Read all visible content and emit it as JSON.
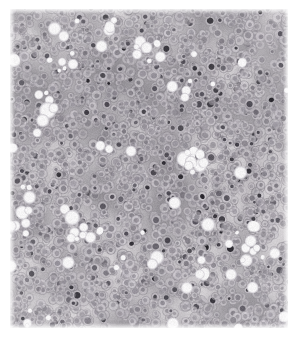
{
  "image": {
    "kind": "histopathology-micrograph",
    "subject": "dense sheet of round tumour cells with hyperchromatic nuclei and scattered clear lacunae",
    "stain_appearance": "desaturated haematoxylin-and-eosin, near-greyscale with faint lavender cast",
    "width": 296,
    "height": 337,
    "background_color": "#ffffff",
    "margins": {
      "top": 9,
      "right": 8,
      "bottom": 9,
      "left": 10
    },
    "tissue_area": {
      "x": 10,
      "y": 9,
      "width": 278,
      "height": 319
    },
    "caption": "Histological section: densely cellular field of uniform round cells with dark nuclei, interspersed pale vacuolar spaces and faint fibrous streaks."
  },
  "palette": {
    "paper_white": "#ffffff",
    "tissue_base": "#b9b5ba",
    "tissue_light": "#d6d3d6",
    "tissue_dark": "#8d8a90",
    "cytoplasm": "#c2bec4",
    "nucleus_mid": "#7e7a83",
    "nucleus_dark": "#4a4750",
    "nucleus_black": "#2b2930",
    "lacuna_white": "#f6f5f6",
    "lacuna_rim": "#cecbd1",
    "fiber_streak": "#a9a5ac"
  },
  "texture": {
    "noise_amount": 22,
    "base_blotch_count": 180,
    "base_blotch_radius": [
      14,
      46
    ],
    "cell_count": 2600,
    "cell_radius": [
      3.0,
      5.6
    ],
    "nucleus_ratio": [
      0.38,
      0.62
    ],
    "dark_nucleus_fraction": 0.17,
    "very_dark_nucleus_fraction": 0.055,
    "lacuna_count": 46,
    "lacuna_radius": [
      3.5,
      11.0
    ],
    "lacuna_cluster_count": 9,
    "fiber_streak_count": 26,
    "vignette_strength": 0.06,
    "seed": 20250117
  },
  "features": [
    {
      "name": "large-lacuna-upper-left",
      "x": 60,
      "y": 34,
      "radius": 9
    },
    {
      "name": "large-lacuna-upper-mid",
      "x": 107,
      "y": 31,
      "radius": 8
    },
    {
      "name": "lacuna-cluster-left-mid",
      "x": 48,
      "y": 104,
      "radius": 11
    },
    {
      "name": "lacuna-cluster-center",
      "x": 107,
      "y": 148,
      "radius": 10
    },
    {
      "name": "lacuna-cluster-center-right",
      "x": 193,
      "y": 157,
      "radius": 12
    },
    {
      "name": "lacuna-cluster-lower-left",
      "x": 66,
      "y": 216,
      "radius": 10
    },
    {
      "name": "lacuna-cluster-lower-center",
      "x": 158,
      "y": 262,
      "radius": 9
    },
    {
      "name": "lacuna-cluster-right-lower",
      "x": 247,
      "y": 246,
      "radius": 8
    },
    {
      "name": "fibrous-band-upper-left",
      "x": 34,
      "y": 52,
      "radius": 18
    }
  ]
}
